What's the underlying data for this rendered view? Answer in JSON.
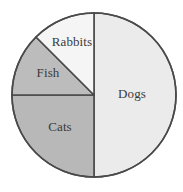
{
  "chart_data": {
    "type": "pie",
    "title": "",
    "subtitle": "",
    "xlabel": "",
    "ylabel": "",
    "legend_position": "none",
    "labels_inside_slices": true,
    "categories": [
      "Dogs",
      "Cats",
      "Fish",
      "Rabbits"
    ],
    "values": [
      50,
      25,
      12.5,
      12.5
    ],
    "value_unit": "percent",
    "total": 100,
    "start_angle_deg": 0,
    "direction": "clockwise",
    "slices": [
      {
        "label": "Dogs",
        "value": 50,
        "percent": 50,
        "start_angle_deg": 0,
        "end_angle_deg": 180,
        "color": "#ebebeb",
        "label_x": 132,
        "label_y": 95
      },
      {
        "label": "Cats",
        "value": 25,
        "percent": 25,
        "start_angle_deg": 180,
        "end_angle_deg": 270,
        "color": "#b8b8b8",
        "label_x": 60,
        "label_y": 128
      },
      {
        "label": "Fish",
        "value": 12.5,
        "percent": 12.5,
        "start_angle_deg": 270,
        "end_angle_deg": 315,
        "color": "#bcbcbc",
        "label_x": 48,
        "label_y": 74
      },
      {
        "label": "Rabbits",
        "value": 12.5,
        "percent": 12.5,
        "start_angle_deg": 315,
        "end_angle_deg": 360,
        "color": "#f5f5f5",
        "label_x": 72,
        "label_y": 43
      }
    ],
    "geometry": {
      "center_x": 94,
      "center_y": 95,
      "radius": 82
    },
    "colors": {
      "outline": "#4a4a4a",
      "label_text": "#3a3a3a",
      "background": "#ffffff"
    }
  }
}
